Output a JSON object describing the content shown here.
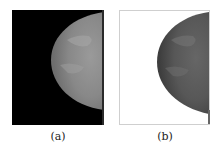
{
  "figure": {
    "panels": [
      {
        "id": "a",
        "caption": "(a)",
        "description": "Mammogram with black background",
        "background_color": "#000000",
        "tissue_color": "#8a8a8a"
      },
      {
        "id": "b",
        "caption": "(b)",
        "description": "Mammogram with background removed (white), tissue darkened",
        "background_color": "#ffffff",
        "tissue_color": "#555555"
      }
    ]
  }
}
